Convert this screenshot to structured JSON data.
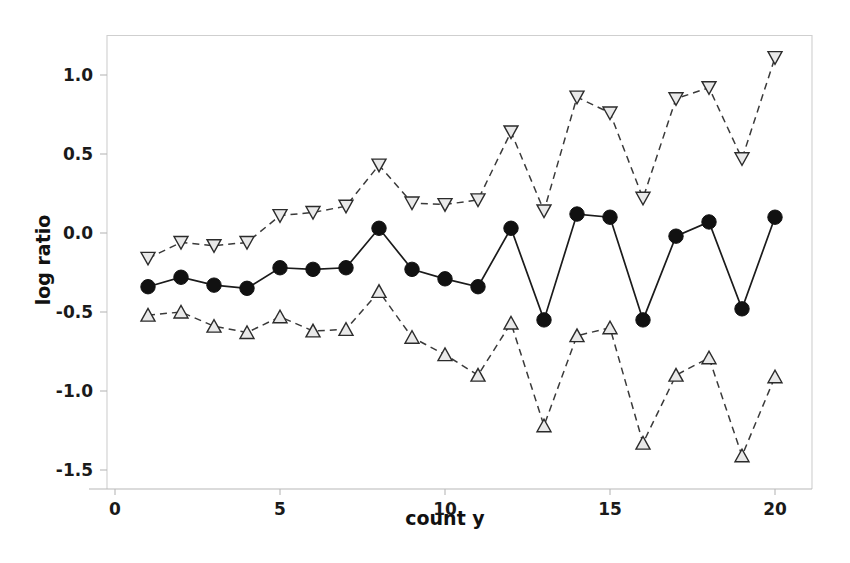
{
  "chart_data": {
    "type": "line",
    "title": "",
    "subtitle": "",
    "xlabel": "count y",
    "ylabel": "log ratio",
    "xlim": [
      0,
      21
    ],
    "ylim": [
      -1.62,
      1.25
    ],
    "xticks": [
      0,
      5,
      10,
      15,
      20
    ],
    "xtick_labels": [
      "0",
      "5",
      "10",
      "15",
      "20"
    ],
    "yticks": [
      1.0,
      0.5,
      0.0,
      -0.5,
      -1.0,
      -1.5
    ],
    "ytick_labels": [
      "1.0",
      "0.5",
      "0.0",
      "-0.5",
      "-1.0",
      "-1.5"
    ],
    "grid": false,
    "legend": "none",
    "x": [
      1,
      2,
      3,
      4,
      5,
      6,
      7,
      8,
      9,
      10,
      11,
      12,
      13,
      14,
      15,
      16,
      17,
      18,
      19,
      20
    ],
    "series": [
      {
        "name": "upper limit",
        "marker": "triangle-down",
        "linestyle": "dashed",
        "color": "#2b2b2b",
        "values": [
          -0.16,
          -0.06,
          -0.08,
          -0.06,
          0.11,
          0.13,
          0.17,
          0.43,
          0.19,
          0.18,
          0.21,
          0.64,
          0.14,
          0.86,
          0.76,
          0.22,
          0.85,
          0.92,
          0.47,
          1.11
        ]
      },
      {
        "name": "estimate",
        "marker": "circle",
        "linestyle": "solid",
        "color": "#111111",
        "values": [
          -0.34,
          -0.28,
          -0.33,
          -0.35,
          -0.22,
          -0.23,
          -0.22,
          0.03,
          -0.23,
          -0.29,
          -0.34,
          0.03,
          -0.55,
          0.12,
          0.1,
          -0.55,
          -0.02,
          0.07,
          -0.48,
          0.1
        ]
      },
      {
        "name": "lower limit",
        "marker": "triangle-up",
        "linestyle": "dashed",
        "color": "#2b2b2b",
        "values": [
          -0.52,
          -0.5,
          -0.59,
          -0.63,
          -0.53,
          -0.62,
          -0.61,
          -0.37,
          -0.66,
          -0.77,
          -0.9,
          -0.57,
          -1.22,
          -0.65,
          -0.6,
          -1.33,
          -0.9,
          -0.79,
          -1.41,
          -0.91
        ]
      }
    ]
  },
  "axis": {
    "x_title": "count y",
    "y_title": "log ratio"
  }
}
